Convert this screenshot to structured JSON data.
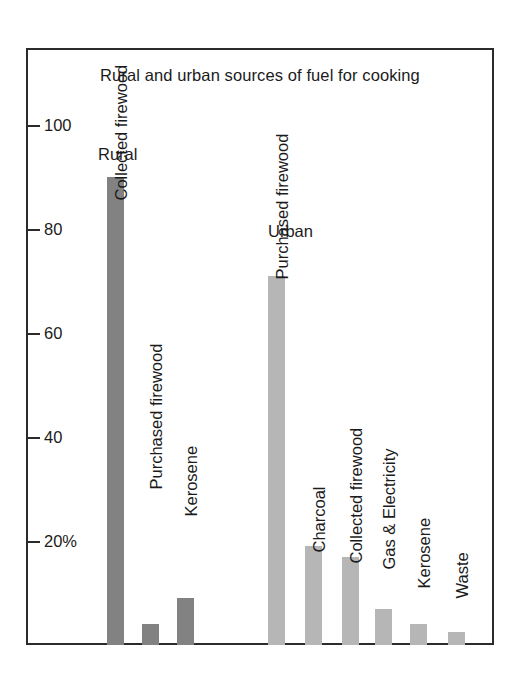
{
  "chart_data": {
    "type": "bar",
    "title": "Rural and urban sources of fuel for cooking",
    "xlabel": "",
    "ylabel": "",
    "ylim": [
      0,
      105
    ],
    "grid": false,
    "legend": "none",
    "y_ticks": [
      {
        "value": 100,
        "label": "100"
      },
      {
        "value": 80,
        "label": "80"
      },
      {
        "value": 60,
        "label": "60"
      },
      {
        "value": 40,
        "label": "40"
      },
      {
        "value": 20,
        "label": "20%"
      }
    ],
    "group_labels": [
      "Rural",
      "Urban"
    ],
    "categories": [
      "Collected firewood",
      "Purchased firewood",
      "Kerosene",
      "Purchased firewood",
      "Charcoal",
      "Collected firewood",
      "Gas & Electricity",
      "Kerosene",
      "Waste"
    ],
    "values": [
      90,
      4,
      9,
      71,
      19,
      17,
      7,
      4,
      2.5
    ],
    "series": [
      {
        "name": "Rural",
        "color": "#828282",
        "points": [
          {
            "label": "Collected firewood",
            "value": 90
          },
          {
            "label": "Purchased firewood",
            "value": 4
          },
          {
            "label": "Kerosene",
            "value": 9
          }
        ]
      },
      {
        "name": "Urban",
        "color": "#b6b6b6",
        "points": [
          {
            "label": "Purchased firewood",
            "value": 71
          },
          {
            "label": "Charcoal",
            "value": 19
          },
          {
            "label": "Collected firewood",
            "value": 17
          },
          {
            "label": "Gas & Electricity",
            "value": 7
          },
          {
            "label": "Kerosene",
            "value": 4
          },
          {
            "label": "Waste",
            "value": 2.5
          }
        ]
      }
    ]
  },
  "axis": {
    "tick_100": "100",
    "tick_80": "80",
    "tick_60": "60",
    "tick_40": "40",
    "tick_20": "20%"
  },
  "groups": {
    "rural": "Rural",
    "urban": "Urban"
  },
  "bars": {
    "b1": "Collected firewood",
    "b2": "Purchased firewood",
    "b3": "Kerosene",
    "b4": "Purchased firewood",
    "b5": "Charcoal",
    "b6": "Collected firewood",
    "b7": "Gas & Electricity",
    "b8": "Kerosene",
    "b9": "Waste"
  },
  "colors": {
    "rural_bar": "#828282",
    "urban_bar": "#b6b6b6",
    "frame": "#2b2b2b",
    "text": "#1b1b1b",
    "background": "#ffffff"
  }
}
